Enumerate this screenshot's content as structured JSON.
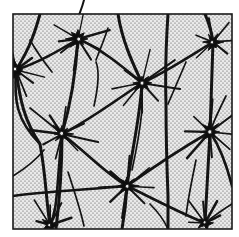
{
  "figure": {
    "kind": "crack-network-micrograph",
    "title": "",
    "caption": "",
    "background_color": "#ffffff",
    "frame": {
      "name": "specimen-frame",
      "stroke_color": "#1a1a1a",
      "stroke_width": 1.6,
      "x": 13,
      "y": 14,
      "width": 219,
      "height": 215
    },
    "field": {
      "name": "stippled-matrix",
      "fill_color": "#e9e9e9",
      "stipple_color": "#4a4a4a",
      "stipple_spacing": 4,
      "stipple_dot_radius": 0.62
    },
    "network": {
      "line_color": "#141414",
      "thick_width": 3.1,
      "medium_width": 2.1,
      "thin_width": 1.25,
      "node_color": "#0d0d0d",
      "node_count": 8,
      "boundary_count": 11,
      "radial_crack_count": 44
    },
    "nodes": [
      {
        "name": "node-left-upper",
        "x": 16,
        "y": 70,
        "r": 9.0,
        "rays": 7
      },
      {
        "name": "node-top-left",
        "x": 78,
        "y": 39,
        "r": 9.5,
        "rays": 8
      },
      {
        "name": "node-top-right",
        "x": 213,
        "y": 42,
        "r": 8.0,
        "rays": 6
      },
      {
        "name": "node-center",
        "x": 142,
        "y": 83,
        "r": 9.5,
        "rays": 8
      },
      {
        "name": "node-left-mid",
        "x": 62,
        "y": 134,
        "r": 9.5,
        "rays": 8
      },
      {
        "name": "node-right-mid",
        "x": 210,
        "y": 132,
        "r": 10.0,
        "rays": 8
      },
      {
        "name": "node-center-lower",
        "x": 127,
        "y": 186,
        "r": 9.0,
        "rays": 8
      },
      {
        "name": "node-bottom-left",
        "x": 50,
        "y": 225,
        "r": 7.5,
        "rays": 5
      },
      {
        "name": "node-bottom-right",
        "x": 205,
        "y": 223,
        "r": 7.5,
        "rays": 5
      }
    ],
    "boundaries": [
      {
        "name": "boundary-v-1",
        "path": "M 40 14 C 33 40, 26 54, 16 70 C 20 100, 24 120, 40 144 C 46 176, 46 200, 50 225"
      },
      {
        "name": "boundary-v-2",
        "path": "M 78 39 C 76 70, 72 100, 62 134 C 62 162, 60 196, 56 229"
      },
      {
        "name": "boundary-v-3",
        "path": "M 118 14 C 122 40, 132 62, 142 83 C 140 118, 132 150, 127 186 C 126 204, 124 218, 122 229"
      },
      {
        "name": "boundary-v-4",
        "path": "M 168 14 C 166 44, 165 70, 166 104 C 166 140, 167 170, 168 196 C 168 212, 168 222, 168 229"
      },
      {
        "name": "boundary-v-5",
        "path": "M 205 14 C 210 26, 212 34, 213 42 C 212 74, 211 104, 210 132 C 208 166, 206 200, 205 223"
      },
      {
        "name": "boundary-h-1",
        "path": "M 16 70 C 40 62, 60 50, 78 39"
      },
      {
        "name": "boundary-h-2",
        "path": "M 78 39 C 100 48, 122 66, 142 83"
      },
      {
        "name": "boundary-h-3",
        "path": "M 142 83 C 166 72, 190 56, 213 42"
      },
      {
        "name": "boundary-h-4",
        "path": "M 62 134 C 90 120, 116 100, 142 83"
      },
      {
        "name": "boundary-h-5",
        "path": "M 62 134 C 86 152, 104 172, 127 186"
      },
      {
        "name": "boundary-h-6",
        "path": "M 127 186 C 152 168, 182 148, 210 132"
      },
      {
        "name": "boundary-h-7",
        "path": "M 127 186 C 152 198, 178 212, 205 223"
      },
      {
        "name": "boundary-h-8",
        "path": "M 50 225 C 58 208, 56 192, 62 134"
      },
      {
        "name": "boundary-h-9",
        "path": "M 16 70 C 14 100, 16 120, 40 144"
      },
      {
        "name": "boundary-h-10",
        "path": "M 210 132 C 222 150, 228 170, 232 186"
      },
      {
        "name": "boundary-h-11",
        "path": "M 13 196 C 40 192, 80 190, 127 186"
      }
    ],
    "radial_cracks": [
      {
        "node": "node-top-left",
        "angles": [
          -72,
          -18,
          20,
          58,
          96,
          140,
          176,
          214
        ],
        "lengths": [
          38,
          30,
          26,
          24,
          34,
          22,
          20,
          26
        ]
      },
      {
        "node": "node-left-upper",
        "angles": [
          -40,
          8,
          40,
          74,
          118,
          160,
          206,
          250
        ],
        "lengths": [
          24,
          30,
          22,
          26,
          20,
          18,
          22,
          16
        ]
      },
      {
        "node": "node-center",
        "angles": [
          -80,
          -34,
          12,
          46,
          92,
          132,
          172,
          216
        ],
        "lengths": [
          34,
          40,
          36,
          24,
          30,
          26,
          32,
          22
        ]
      },
      {
        "node": "node-top-right",
        "angles": [
          -100,
          -52,
          -10,
          40,
          130,
          200
        ],
        "lengths": [
          26,
          24,
          20,
          22,
          24,
          18
        ]
      },
      {
        "node": "node-left-mid",
        "angles": [
          -78,
          -30,
          16,
          54,
          100,
          146,
          186,
          230
        ],
        "lengths": [
          30,
          26,
          34,
          24,
          28,
          22,
          30,
          20
        ]
      },
      {
        "node": "node-right-mid",
        "angles": [
          -86,
          -40,
          6,
          44,
          90,
          134,
          178,
          224
        ],
        "lengths": [
          30,
          26,
          22,
          28,
          24,
          34,
          28,
          22
        ]
      },
      {
        "node": "node-center-lower",
        "angles": [
          -84,
          -36,
          10,
          50,
          96,
          140,
          184,
          226
        ],
        "lengths": [
          28,
          30,
          26,
          24,
          30,
          22,
          26,
          20
        ]
      },
      {
        "node": "node-bottom-left",
        "angles": [
          -120,
          -86,
          -54,
          -16,
          186
        ],
        "lengths": [
          26,
          22,
          24,
          20,
          14
        ]
      },
      {
        "node": "node-bottom-right",
        "angles": [
          -126,
          -90,
          -56,
          -14,
          182
        ],
        "lengths": [
          28,
          22,
          24,
          18,
          14
        ]
      }
    ],
    "stray_cracks": [
      {
        "name": "stray-above-frame",
        "path": "M 84 0 C 82 8, 80 12, 78 18"
      },
      {
        "name": "stray-left-edge",
        "path": "M 13 176 C 26 168, 36 160, 44 150"
      },
      {
        "name": "stray-mid-left",
        "path": "M 30 108 C 40 116, 50 124, 62 134"
      },
      {
        "name": "stray-mid-top",
        "path": "M 96 62 C 100 72, 98 88, 94 106"
      },
      {
        "name": "stray-upper-right",
        "path": "M 186 62 C 180 76, 174 90, 168 104"
      },
      {
        "name": "stray-center-down",
        "path": "M 142 110 C 140 130, 136 152, 132 170"
      },
      {
        "name": "stray-low-right",
        "path": "M 196 160 C 192 180, 188 198, 186 216"
      },
      {
        "name": "stray-low-left",
        "path": "M 68 172 C 74 190, 80 208, 84 226"
      },
      {
        "name": "stray-bottom-mid",
        "path": "M 150 204 C 158 212, 164 220, 168 229"
      },
      {
        "name": "stray-right-lower",
        "path": "M 232 204 C 222 210, 214 216, 205 223"
      }
    ]
  }
}
